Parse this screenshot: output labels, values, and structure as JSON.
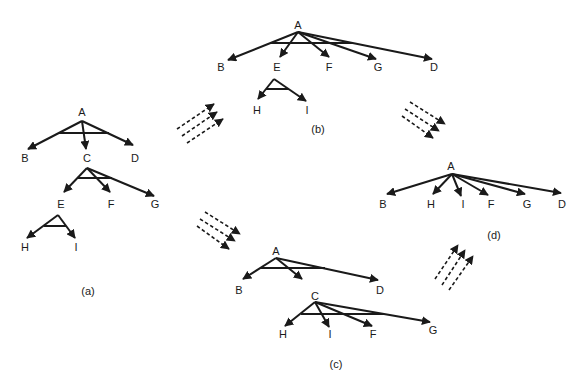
{
  "diagram": {
    "panels": [
      {
        "id": "a",
        "caption": "(a)",
        "nodes": [
          {
            "id": "A",
            "label": "A",
            "x": 82,
            "y": 108
          },
          {
            "id": "B",
            "label": "B",
            "x": 25,
            "y": 161
          },
          {
            "id": "C",
            "label": "C",
            "x": 87,
            "y": 161
          },
          {
            "id": "D",
            "label": "D",
            "x": 135,
            "y": 161
          },
          {
            "id": "E",
            "label": "E",
            "x": 61,
            "y": 207
          },
          {
            "id": "F",
            "label": "F",
            "x": 111,
            "y": 207
          },
          {
            "id": "G",
            "label": "G",
            "x": 155,
            "y": 207
          },
          {
            "id": "H",
            "label": "H",
            "x": 25,
            "y": 250
          },
          {
            "id": "I",
            "label": "I",
            "x": 76,
            "y": 250
          }
        ],
        "edges": [
          [
            "A",
            "B"
          ],
          [
            "A",
            "C"
          ],
          [
            "A",
            "D"
          ],
          [
            "C",
            "E"
          ],
          [
            "C",
            "F"
          ],
          [
            "C",
            "G"
          ],
          [
            "E",
            "H"
          ],
          [
            "E",
            "I"
          ]
        ]
      },
      {
        "id": "b",
        "caption": "(b)",
        "nodes": [
          {
            "id": "A",
            "label": "A",
            "x": 298,
            "y": 24
          },
          {
            "id": "B",
            "label": "B",
            "x": 221,
            "y": 67
          },
          {
            "id": "E",
            "label": "E",
            "x": 277,
            "y": 67
          },
          {
            "id": "F",
            "label": "F",
            "x": 329,
            "y": 67
          },
          {
            "id": "G",
            "label": "G",
            "x": 378,
            "y": 67
          },
          {
            "id": "D",
            "label": "D",
            "x": 434,
            "y": 67
          },
          {
            "id": "H",
            "label": "H",
            "x": 257,
            "y": 110
          },
          {
            "id": "I",
            "label": "I",
            "x": 307,
            "y": 110
          }
        ],
        "edges": [
          [
            "A",
            "B"
          ],
          [
            "A",
            "E"
          ],
          [
            "A",
            "F"
          ],
          [
            "A",
            "G"
          ],
          [
            "A",
            "D"
          ],
          [
            "E",
            "H"
          ],
          [
            "E",
            "I"
          ]
        ]
      },
      {
        "id": "c",
        "caption": "(c)",
        "nodes": [
          {
            "id": "A",
            "label": "A",
            "x": 276,
            "y": 251
          },
          {
            "id": "B",
            "label": "B",
            "x": 239,
            "y": 290
          },
          {
            "id": "D",
            "label": "D",
            "x": 380,
            "y": 290
          },
          {
            "id": "C",
            "label": "C",
            "x": 315,
            "y": 296
          },
          {
            "id": "H",
            "label": "H",
            "x": 283,
            "y": 334
          },
          {
            "id": "I",
            "label": "I",
            "x": 330,
            "y": 334
          },
          {
            "id": "F",
            "label": "F",
            "x": 373,
            "y": 334
          },
          {
            "id": "G",
            "label": "G",
            "x": 433,
            "y": 330
          }
        ],
        "edges": [
          [
            "A",
            "B"
          ],
          [
            "A",
            "mid"
          ],
          [
            "A",
            "D"
          ],
          [
            "C",
            "H"
          ],
          [
            "C",
            "I"
          ],
          [
            "C",
            "F"
          ],
          [
            "C",
            "G"
          ]
        ]
      },
      {
        "id": "d",
        "caption": "(d)",
        "nodes": [
          {
            "id": "A",
            "label": "A",
            "x": 451,
            "y": 165
          },
          {
            "id": "B",
            "label": "B",
            "x": 383,
            "y": 204
          },
          {
            "id": "H",
            "label": "H",
            "x": 431,
            "y": 204
          },
          {
            "id": "I",
            "label": "I",
            "x": 463,
            "y": 204
          },
          {
            "id": "F",
            "label": "F",
            "x": 491,
            "y": 204
          },
          {
            "id": "G",
            "label": "G",
            "x": 527,
            "y": 204
          },
          {
            "id": "D",
            "label": "D",
            "x": 562,
            "y": 204
          }
        ],
        "edges": [
          [
            "A",
            "B"
          ],
          [
            "A",
            "H"
          ],
          [
            "A",
            "I"
          ],
          [
            "A",
            "F"
          ],
          [
            "A",
            "G"
          ],
          [
            "A",
            "D"
          ]
        ]
      }
    ],
    "transitions": [
      {
        "from": "a",
        "to": "b",
        "direction": "up-right"
      },
      {
        "from": "a",
        "to": "c",
        "direction": "down-right"
      },
      {
        "from": "b",
        "to": "d",
        "direction": "down-right"
      },
      {
        "from": "c",
        "to": "d",
        "direction": "up-right"
      }
    ]
  },
  "labels": {
    "a": {
      "A": "A",
      "B": "B",
      "C": "C",
      "D": "D",
      "E": "E",
      "F": "F",
      "G": "G",
      "H": "H",
      "I": "I",
      "caption": "(a)"
    },
    "b": {
      "A": "A",
      "B": "B",
      "E": "E",
      "F": "F",
      "G": "G",
      "D": "D",
      "H": "H",
      "I": "I",
      "caption": "(b)"
    },
    "c": {
      "A": "A",
      "B": "B",
      "D": "D",
      "C": "C",
      "H": "H",
      "I": "I",
      "F": "F",
      "G": "G",
      "caption": "(c)"
    },
    "d": {
      "A": "A",
      "B": "B",
      "H": "H",
      "I": "I",
      "F": "F",
      "G": "G",
      "D": "D",
      "caption": "(d)"
    }
  },
  "colors": {
    "ink": "#1a1a1a",
    "background": "#ffffff"
  }
}
